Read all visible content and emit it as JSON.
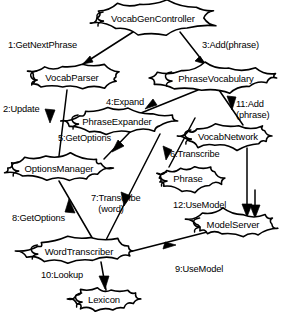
{
  "diagram": {
    "type": "uml-collaboration-diagram",
    "stroke_color": "#000000",
    "fill_color": "#ffffff",
    "objects": [
      {
        "id": "vocabgencontroller",
        "label": "VocabGenController",
        "cx": 153,
        "cy": 18,
        "rx": 63,
        "ry": 15
      },
      {
        "id": "vocabparser",
        "label": "VocabParser",
        "cx": 72,
        "cy": 77,
        "rx": 47,
        "ry": 13
      },
      {
        "id": "phrasevocabulary",
        "label": "PhraseVocabulary",
        "cx": 216,
        "cy": 78,
        "rx": 57,
        "ry": 13
      },
      {
        "id": "phraseexpander",
        "label": "PhraseExpander",
        "cx": 117,
        "cy": 121,
        "rx": 51,
        "ry": 12
      },
      {
        "id": "vocabnetwork",
        "label": "VocabNetwork",
        "cx": 228,
        "cy": 136,
        "rx": 49,
        "ry": 12
      },
      {
        "id": "optionsmanager",
        "label": "OptionsManager",
        "cx": 59,
        "cy": 168,
        "rx": 53,
        "ry": 13
      },
      {
        "id": "phrase",
        "label": "Phrase",
        "cx": 188,
        "cy": 178,
        "rx": 32,
        "ry": 12
      },
      {
        "id": "modelserver",
        "label": "ModelServer",
        "cx": 233,
        "cy": 224,
        "rx": 45,
        "ry": 13
      },
      {
        "id": "wordtranscriber",
        "label": "WordTranscriber",
        "cx": 79,
        "cy": 251,
        "rx": 54,
        "ry": 13
      },
      {
        "id": "lexicon",
        "label": "Lexicon",
        "cx": 104,
        "cy": 299,
        "rx": 33,
        "ry": 11
      }
    ],
    "messages": [
      {
        "seq": "1",
        "name": "GetNextPhrase",
        "text": "1:GetNextPhrase",
        "from": "vocabgencontroller",
        "to": "vocabparser",
        "label_x": 8,
        "label_y": 40
      },
      {
        "seq": "2",
        "name": "Update",
        "text": "2:Update",
        "from": "vocabparser",
        "to": "optionsmanager",
        "label_x": 3,
        "label_y": 104
      },
      {
        "seq": "3",
        "name": "Add(phrase)",
        "text": "3:Add(phrase)",
        "from": "vocabgencontroller",
        "to": "phrasevocabulary",
        "label_x": 202,
        "label_y": 40
      },
      {
        "seq": "4",
        "name": "Expand",
        "text": "4:Expand",
        "from": "phrasevocabulary",
        "to": "phraseexpander",
        "label_x": 106,
        "label_y": 97
      },
      {
        "seq": "5",
        "name": "GetOptions",
        "text": "5:GetOptions",
        "from": "phraseexpander",
        "to": "optionsmanager",
        "label_x": 58,
        "label_y": 133
      },
      {
        "seq": "6",
        "name": "Transcribe",
        "text": "6:Transcribe",
        "from": "vocabnetwork",
        "to": "phrase",
        "label_x": 170,
        "label_y": 149
      },
      {
        "seq": "7",
        "name": "Transcribe(word)",
        "text": "7:Transcribe\n   (word)",
        "from": "phraseexpander",
        "to": "wordtranscriber",
        "label_x": 91,
        "label_y": 193
      },
      {
        "seq": "8",
        "name": "GetOptions",
        "text": "8:GetOptions",
        "from": "optionsmanager",
        "to": "wordtranscriber",
        "label_x": 12,
        "label_y": 213
      },
      {
        "seq": "9",
        "name": "UseModel",
        "text": "9:UseModel",
        "from": "wordtranscriber",
        "to": "modelserver",
        "label_x": 175,
        "label_y": 264
      },
      {
        "seq": "10",
        "name": "Lookup",
        "text": "10:Lookup",
        "from": "wordtranscriber",
        "to": "lexicon",
        "label_x": 41,
        "label_y": 270
      },
      {
        "seq": "11",
        "name": "Add(phrase)",
        "text": "11:Add\n(phrase)",
        "from": "phrasevocabulary",
        "to": "vocabnetwork",
        "label_x": 236,
        "label_y": 99
      },
      {
        "seq": "12",
        "name": "UseModel",
        "text": "12:UseModel",
        "from": "phrase",
        "to": "modelserver",
        "label_x": 173,
        "label_y": 200
      }
    ]
  }
}
